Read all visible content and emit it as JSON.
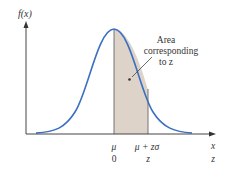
{
  "diagram": {
    "y_axis_label": "f(x)",
    "x_axis_label": "x",
    "annotation": {
      "line1": "Area",
      "line2": "corresponding",
      "line3": "to z"
    },
    "ticks": {
      "mean": {
        "top": "μ",
        "bottom": "0"
      },
      "z_point": {
        "top": "μ + zσ",
        "bottom": "z"
      },
      "axis_end": {
        "top": "x",
        "bottom": "z"
      }
    },
    "colors": {
      "curve": "#3a6fc4",
      "shade": "#ddd3c9",
      "axis": "#444444",
      "text": "#333333"
    }
  }
}
